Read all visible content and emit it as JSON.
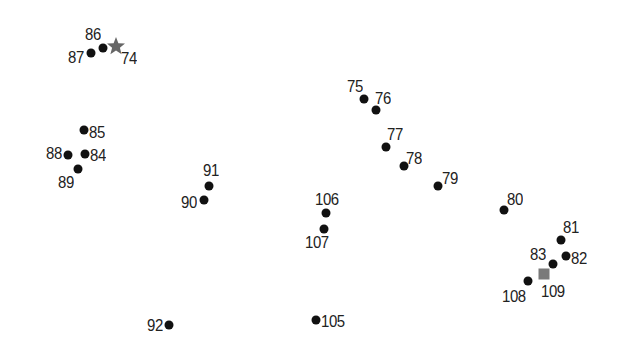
{
  "puzzle": {
    "type": "connect-the-dots",
    "start_marker": {
      "label": "74",
      "shape": "star",
      "color": "#666666",
      "x": 116,
      "y": 46
    },
    "end_marker": {
      "label": "109",
      "shape": "square",
      "color": "#7a7a7a",
      "x": 544,
      "y": 274
    },
    "points": [
      {
        "label": "75",
        "x": 364,
        "y": 99,
        "lx": 347,
        "ly": 78
      },
      {
        "label": "76",
        "x": 376,
        "y": 110,
        "lx": 375,
        "ly": 90
      },
      {
        "label": "77",
        "x": 386,
        "y": 147,
        "lx": 387,
        "ly": 126
      },
      {
        "label": "78",
        "x": 404,
        "y": 166,
        "lx": 406,
        "ly": 150
      },
      {
        "label": "79",
        "x": 438,
        "y": 186,
        "lx": 442,
        "ly": 170
      },
      {
        "label": "80",
        "x": 504,
        "y": 210,
        "lx": 507,
        "ly": 191
      },
      {
        "label": "81",
        "x": 561,
        "y": 240,
        "lx": 563,
        "ly": 219
      },
      {
        "label": "82",
        "x": 566,
        "y": 256,
        "lx": 571,
        "ly": 250
      },
      {
        "label": "83",
        "x": 553,
        "y": 264,
        "lx": 530,
        "ly": 246
      },
      {
        "label": "84",
        "x": 85,
        "y": 154,
        "lx": 90,
        "ly": 147
      },
      {
        "label": "85",
        "x": 84,
        "y": 130,
        "lx": 89,
        "ly": 124
      },
      {
        "label": "86",
        "x": 103,
        "y": 48,
        "lx": 85,
        "ly": 26
      },
      {
        "label": "87",
        "x": 91,
        "y": 53,
        "lx": 68,
        "ly": 49
      },
      {
        "label": "88",
        "x": 68,
        "y": 155,
        "lx": 46,
        "ly": 145
      },
      {
        "label": "89",
        "x": 78,
        "y": 169,
        "lx": 58,
        "ly": 174
      },
      {
        "label": "90",
        "x": 204,
        "y": 200,
        "lx": 181,
        "ly": 194
      },
      {
        "label": "91",
        "x": 209,
        "y": 186,
        "lx": 203,
        "ly": 162
      },
      {
        "label": "92",
        "x": 169,
        "y": 325,
        "lx": 147,
        "ly": 317
      },
      {
        "label": "105",
        "x": 316,
        "y": 320,
        "lx": 321,
        "ly": 313
      },
      {
        "label": "106",
        "x": 326,
        "y": 213,
        "lx": 315,
        "ly": 191
      },
      {
        "label": "107",
        "x": 324,
        "y": 229,
        "lx": 305,
        "ly": 234
      },
      {
        "label": "108",
        "x": 528,
        "y": 281,
        "lx": 502,
        "ly": 288
      }
    ],
    "start_label_pos": {
      "lx": 121,
      "ly": 50
    },
    "end_label_pos": {
      "lx": 541,
      "ly": 283
    }
  }
}
